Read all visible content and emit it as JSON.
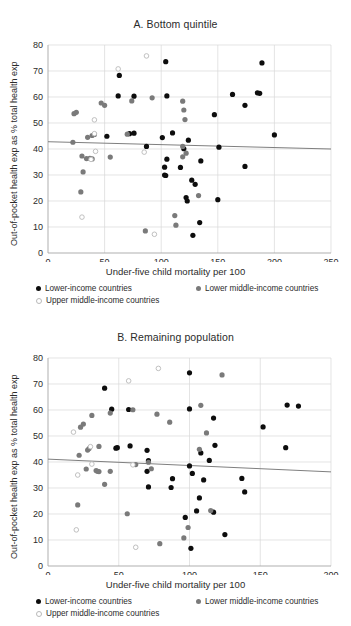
{
  "figure": {
    "axis_label_y": "Out-of-pocket health exp as % total health exp",
    "axis_label_x": "Under-five child mortality per 100",
    "legend": {
      "lower_income": "Lower-income countries",
      "lower_middle_income": "Lower middle-income countries",
      "upper_middle_income": "Upper middle-income countries"
    },
    "colors": {
      "lower_income": "#0d0d0d",
      "lower_middle_income": "#7a7a7a",
      "upper_middle_income": "#ffffff",
      "upper_middle_income_edge": "#b9b9b9",
      "gridline": "#d9d9d9",
      "axis": "#808080",
      "trendline": "#7f7f7f"
    }
  },
  "chart_data": [
    {
      "type": "scatter",
      "panel": "A",
      "title": "A. Bottom quintile",
      "xlabel": "Under-five child mortality per 100",
      "ylabel": "Out-of-pocket health exp as % total health exp",
      "xlim": [
        0,
        250
      ],
      "ylim": [
        0,
        80
      ],
      "xticks": [
        0,
        50,
        100,
        150,
        200,
        250
      ],
      "yticks": [
        0,
        10,
        20,
        30,
        40,
        50,
        60,
        70,
        80
      ],
      "grid": true,
      "legend_position": "below",
      "trendline": {
        "x0": 0,
        "y0": 42.8,
        "x1": 250,
        "y1": 40.0
      },
      "series": [
        {
          "name": "Lower-income countries",
          "color": "#0d0d0d",
          "marker": "filled-circle",
          "points": [
            [
              63,
              68.3
            ],
            [
              104,
              73.6
            ],
            [
              189,
              73.1
            ],
            [
              62,
              60.4
            ],
            [
              76,
              60.3
            ],
            [
              105,
              60.4
            ],
            [
              163,
              61.0
            ],
            [
              185,
              61.6
            ],
            [
              187,
              61.4
            ],
            [
              174,
              56.8
            ],
            [
              147,
              53.2
            ],
            [
              200,
              45.4
            ],
            [
              52,
              44.9
            ],
            [
              72,
              45.9
            ],
            [
              76,
              46.1
            ],
            [
              110,
              46.2
            ],
            [
              101,
              44.4
            ],
            [
              87,
              41.0
            ],
            [
              151,
              40.7
            ],
            [
              124,
              43.4
            ],
            [
              120,
              40.1
            ],
            [
              135,
              35.4
            ],
            [
              174,
              33.3
            ],
            [
              105,
              36.1
            ],
            [
              103,
              33.0
            ],
            [
              117,
              32.9
            ],
            [
              103,
              30.0
            ],
            [
              104,
              29.8
            ],
            [
              130,
              26.4
            ],
            [
              127,
              28.0
            ],
            [
              150,
              20.5
            ],
            [
              122,
              21.3
            ],
            [
              123,
              20.0
            ],
            [
              134,
              11.7
            ],
            [
              128,
              6.8
            ]
          ]
        },
        {
          "name": "Lower middle-income countries",
          "color": "#7a7a7a",
          "marker": "filled-circle",
          "points": [
            [
              23,
              53.6
            ],
            [
              25,
              54.1
            ],
            [
              47,
              57.7
            ],
            [
              50,
              56.8
            ],
            [
              74,
              58.5
            ],
            [
              92,
              59.7
            ],
            [
              119,
              58.4
            ],
            [
              120,
              55.0
            ],
            [
              121,
              51.3
            ],
            [
              22,
              42.6
            ],
            [
              35,
              44.5
            ],
            [
              39,
              45.2
            ],
            [
              41,
              45.6
            ],
            [
              70,
              45.7
            ],
            [
              119,
              41.0
            ],
            [
              122,
              38.4
            ],
            [
              119,
              37.0
            ],
            [
              30,
              37.3
            ],
            [
              34,
              36.3
            ],
            [
              37,
              36.4
            ],
            [
              39,
              36.2
            ],
            [
              55,
              36.9
            ],
            [
              31,
              31.2
            ],
            [
              29,
              23.5
            ],
            [
              112,
              14.4
            ],
            [
              113,
              10.7
            ],
            [
              133,
              22.1
            ],
            [
              86,
              8.5
            ]
          ]
        },
        {
          "name": "Upper middle-income countries",
          "color": "#ffffff",
          "marker": "open-circle",
          "points": [
            [
              87,
              75.8
            ],
            [
              62,
              70.8
            ],
            [
              41,
              51.2
            ],
            [
              41,
              45.9
            ],
            [
              42,
              39.1
            ],
            [
              85,
              38.8
            ],
            [
              38,
              36.0
            ],
            [
              30,
              13.8
            ],
            [
              94,
              7.2
            ]
          ]
        }
      ]
    },
    {
      "type": "scatter",
      "panel": "B",
      "title": "B. Remaining population",
      "xlabel": "Under-five child mortality per 100",
      "ylabel": "Out-of-pocket health exp as % total health exp",
      "xlim": [
        0,
        200
      ],
      "ylim": [
        0,
        80
      ],
      "xticks": [
        0,
        50,
        100,
        150,
        200
      ],
      "yticks": [
        0,
        10,
        20,
        30,
        40,
        50,
        60,
        70,
        80
      ],
      "grid": true,
      "legend_position": "below",
      "trendline": {
        "x0": 0,
        "y0": 41.1,
        "x1": 200,
        "y1": 36.2
      },
      "series": [
        {
          "name": "Lower-income countries",
          "color": "#0d0d0d",
          "marker": "filled-circle",
          "points": [
            [
              40,
              68.4
            ],
            [
              100,
              74.3
            ],
            [
              45,
              60.3
            ],
            [
              57,
              60.2
            ],
            [
              100,
              60.4
            ],
            [
              169,
              61.9
            ],
            [
              177,
              61.5
            ],
            [
              117,
              56.9
            ],
            [
              152,
              53.5
            ],
            [
              168,
              45.5
            ],
            [
              48,
              45.3
            ],
            [
              49,
              45.5
            ],
            [
              58,
              46.2
            ],
            [
              70,
              44.5
            ],
            [
              118,
              46.4
            ],
            [
              71,
              40.5
            ],
            [
              100,
              38.5
            ],
            [
              108,
              43.5
            ],
            [
              114,
              40.6
            ],
            [
              70,
              36.4
            ],
            [
              102,
              35.6
            ],
            [
              88,
              33.6
            ],
            [
              137,
              33.7
            ],
            [
              110,
              33.1
            ],
            [
              71,
              30.4
            ],
            [
              87,
              30.2
            ],
            [
              107,
              26.2
            ],
            [
              139,
              28.5
            ],
            [
              105,
              21.2
            ],
            [
              117,
              20.7
            ],
            [
              97,
              18.7
            ],
            [
              125,
              12.1
            ],
            [
              101,
              6.8
            ]
          ]
        },
        {
          "name": "Lower middle-income countries",
          "color": "#7a7a7a",
          "marker": "filled-circle",
          "points": [
            [
              23,
              53.4
            ],
            [
              25,
              54.6
            ],
            [
              31,
              57.9
            ],
            [
              44,
              58.8
            ],
            [
              60,
              60.1
            ],
            [
              77,
              58.4
            ],
            [
              86,
              55.3
            ],
            [
              108,
              61.8
            ],
            [
              112,
              51.2
            ],
            [
              123,
              73.5
            ],
            [
              22,
              42.6
            ],
            [
              28,
              44.6
            ],
            [
              29,
              45.2
            ],
            [
              36,
              46.0
            ],
            [
              27,
              37.3
            ],
            [
              34,
              36.7
            ],
            [
              35,
              36.4
            ],
            [
              36,
              36.3
            ],
            [
              71,
              39.9
            ],
            [
              73,
              37.4
            ],
            [
              40,
              31.4
            ],
            [
              44,
              36.4
            ],
            [
              56,
              20.1
            ],
            [
              21,
              23.5
            ],
            [
              96,
              10.8
            ],
            [
              99,
              14.8
            ],
            [
              79,
              8.6
            ],
            [
              115,
              21.3
            ],
            [
              62,
              39.0
            ],
            [
              107,
              44.9
            ]
          ]
        },
        {
          "name": "Upper middle-income countries",
          "color": "#ffffff",
          "marker": "open-circle",
          "points": [
            [
              78,
              76.0
            ],
            [
              57,
              71.2
            ],
            [
              18,
              51.5
            ],
            [
              30,
              45.9
            ],
            [
              31,
              39.2
            ],
            [
              60,
              38.9
            ],
            [
              21,
              35.0
            ],
            [
              20,
              13.9
            ],
            [
              62,
              7.2
            ]
          ]
        }
      ]
    }
  ]
}
